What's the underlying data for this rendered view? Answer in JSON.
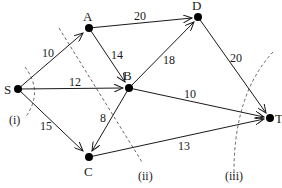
{
  "diagram": {
    "type": "network-flow",
    "nodes": [
      {
        "id": "S",
        "label": "S"
      },
      {
        "id": "A",
        "label": "A"
      },
      {
        "id": "B",
        "label": "B"
      },
      {
        "id": "C",
        "label": "C"
      },
      {
        "id": "D",
        "label": "D"
      },
      {
        "id": "T",
        "label": "T"
      }
    ],
    "edges": [
      {
        "from": "S",
        "to": "A",
        "capacity": "10"
      },
      {
        "from": "S",
        "to": "B",
        "capacity": "12"
      },
      {
        "from": "S",
        "to": "C",
        "capacity": "15"
      },
      {
        "from": "A",
        "to": "B",
        "capacity": "14"
      },
      {
        "from": "A",
        "to": "D",
        "capacity": "20"
      },
      {
        "from": "B",
        "to": "D",
        "capacity": "18"
      },
      {
        "from": "B",
        "to": "C",
        "capacity": "8"
      },
      {
        "from": "B",
        "to": "T",
        "capacity": "10"
      },
      {
        "from": "D",
        "to": "T",
        "capacity": "20"
      },
      {
        "from": "C",
        "to": "T",
        "capacity": "13"
      }
    ],
    "cuts": [
      {
        "id": "i",
        "label": "(i)"
      },
      {
        "id": "ii",
        "label": "(ii)"
      },
      {
        "id": "iii",
        "label": "(iii)"
      }
    ],
    "colors": {
      "ink": "#1a1a1a",
      "cut_line": "#555555",
      "background": "#ffffff"
    }
  }
}
